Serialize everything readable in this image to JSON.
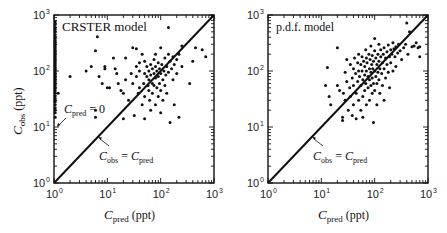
{
  "chart_data": [
    {
      "type": "scatter",
      "title": "CRSTER model",
      "xlabel": "C_pred (ppt)",
      "ylabel": "C_obs (ppt)",
      "xscale": "log",
      "yscale": "log",
      "xlim": [
        1,
        1000
      ],
      "ylim": [
        1,
        1000
      ],
      "x_ticks": [
        "10^0",
        "10^1",
        "10^2",
        "10^3"
      ],
      "y_ticks": [
        "10^0",
        "10^1",
        "10^2",
        "10^3"
      ],
      "annotations": [
        "C_pred = 0",
        "C_obs = C_pred"
      ],
      "reference_line": "y = x",
      "note": "Dense column of points at C_pred = 1 (C_pred = 0 cases) spanning C_obs ~15 to ~800",
      "points": [
        [
          1,
          15
        ],
        [
          1,
          18
        ],
        [
          1,
          20
        ],
        [
          1,
          22
        ],
        [
          1,
          25
        ],
        [
          1,
          28
        ],
        [
          1,
          30
        ],
        [
          1,
          33
        ],
        [
          1,
          36
        ],
        [
          1,
          40
        ],
        [
          1,
          44
        ],
        [
          1,
          48
        ],
        [
          1,
          52
        ],
        [
          1,
          56
        ],
        [
          1,
          60
        ],
        [
          1,
          65
        ],
        [
          1,
          70
        ],
        [
          1,
          75
        ],
        [
          1,
          80
        ],
        [
          1,
          86
        ],
        [
          1,
          92
        ],
        [
          1,
          100
        ],
        [
          1,
          108
        ],
        [
          1,
          116
        ],
        [
          1,
          125
        ],
        [
          1,
          135
        ],
        [
          1,
          145
        ],
        [
          1,
          156
        ],
        [
          1,
          168
        ],
        [
          1,
          180
        ],
        [
          1,
          195
        ],
        [
          1,
          210
        ],
        [
          1,
          225
        ],
        [
          1,
          240
        ],
        [
          1,
          260
        ],
        [
          1,
          280
        ],
        [
          1,
          300
        ],
        [
          1,
          325
        ],
        [
          1,
          350
        ],
        [
          1,
          380
        ],
        [
          1,
          410
        ],
        [
          1,
          450
        ],
        [
          1,
          500
        ],
        [
          1,
          550
        ],
        [
          1,
          600
        ],
        [
          1,
          680
        ],
        [
          1,
          760
        ],
        [
          1.2,
          40
        ],
        [
          2,
          80
        ],
        [
          4,
          100
        ],
        [
          5,
          120
        ],
        [
          6,
          20
        ],
        [
          6,
          15
        ],
        [
          6,
          230
        ],
        [
          6.5,
          410
        ],
        [
          7,
          80
        ],
        [
          8,
          60
        ],
        [
          9,
          120
        ],
        [
          9,
          110
        ],
        [
          10,
          50
        ],
        [
          11,
          50
        ],
        [
          13,
          170
        ],
        [
          14,
          110
        ],
        [
          15,
          90
        ],
        [
          16,
          60
        ],
        [
          18,
          45
        ],
        [
          20,
          40
        ],
        [
          20,
          14
        ],
        [
          22,
          170
        ],
        [
          22,
          70
        ],
        [
          25,
          30
        ],
        [
          28,
          90
        ],
        [
          30,
          260
        ],
        [
          30,
          60
        ],
        [
          32,
          16
        ],
        [
          35,
          250
        ],
        [
          35,
          120
        ],
        [
          35,
          80
        ],
        [
          38,
          40
        ],
        [
          40,
          140
        ],
        [
          40,
          100
        ],
        [
          40,
          50
        ],
        [
          45,
          200
        ],
        [
          45,
          25
        ],
        [
          48,
          60
        ],
        [
          50,
          150
        ],
        [
          50,
          90
        ],
        [
          50,
          35
        ],
        [
          50,
          14
        ],
        [
          55,
          80
        ],
        [
          55,
          120
        ],
        [
          58,
          55
        ],
        [
          60,
          100
        ],
        [
          60,
          70
        ],
        [
          60,
          45
        ],
        [
          62,
          30
        ],
        [
          65,
          130
        ],
        [
          65,
          85
        ],
        [
          65,
          20
        ],
        [
          70,
          110
        ],
        [
          70,
          60
        ],
        [
          70,
          40
        ],
        [
          75,
          160
        ],
        [
          75,
          90
        ],
        [
          75,
          55
        ],
        [
          80,
          200
        ],
        [
          80,
          120
        ],
        [
          80,
          75
        ],
        [
          80,
          25
        ],
        [
          85,
          100
        ],
        [
          85,
          50
        ],
        [
          90,
          140
        ],
        [
          90,
          80
        ],
        [
          90,
          35
        ],
        [
          95,
          110
        ],
        [
          95,
          60
        ],
        [
          100,
          260
        ],
        [
          100,
          90
        ],
        [
          100,
          45
        ],
        [
          100,
          18
        ],
        [
          105,
          130
        ],
        [
          110,
          70
        ],
        [
          110,
          30
        ],
        [
          115,
          100
        ],
        [
          120,
          170
        ],
        [
          120,
          55
        ],
        [
          125,
          85
        ],
        [
          130,
          120
        ],
        [
          130,
          40
        ],
        [
          140,
          600
        ],
        [
          140,
          200
        ],
        [
          140,
          95
        ],
        [
          150,
          150
        ],
        [
          150,
          12
        ],
        [
          160,
          110
        ],
        [
          170,
          180
        ],
        [
          170,
          70
        ],
        [
          180,
          130
        ],
        [
          180,
          25
        ],
        [
          200,
          160
        ],
        [
          200,
          90
        ],
        [
          220,
          200
        ],
        [
          220,
          15
        ],
        [
          250,
          280
        ],
        [
          250,
          120
        ],
        [
          350,
          60
        ],
        [
          400,
          150
        ],
        [
          450,
          260
        ],
        [
          600,
          240
        ],
        [
          700,
          180
        ]
      ]
    },
    {
      "type": "scatter",
      "title": "p.d.f. model",
      "xlabel": "C_pred (ppt)",
      "ylabel": "",
      "xscale": "log",
      "yscale": "log",
      "xlim": [
        1,
        1000
      ],
      "ylim": [
        1,
        1000
      ],
      "x_ticks": [
        "10^0",
        "10^1",
        "10^2",
        "10^3"
      ],
      "y_ticks": [
        "10^0",
        "10^1",
        "10^2",
        "10^3"
      ],
      "annotations": [
        "C_obs = C_pred"
      ],
      "reference_line": "y = x",
      "points": [
        [
          12,
          55
        ],
        [
          13,
          115
        ],
        [
          14,
          35
        ],
        [
          15,
          25
        ],
        [
          20,
          260
        ],
        [
          20,
          55
        ],
        [
          22,
          45
        ],
        [
          25,
          15
        ],
        [
          25,
          13
        ],
        [
          26,
          40
        ],
        [
          28,
          30
        ],
        [
          28,
          95
        ],
        [
          30,
          160
        ],
        [
          30,
          65
        ],
        [
          32,
          20
        ],
        [
          34,
          50
        ],
        [
          35,
          130
        ],
        [
          35,
          35
        ],
        [
          38,
          75
        ],
        [
          38,
          16
        ],
        [
          40,
          110
        ],
        [
          40,
          55
        ],
        [
          40,
          25
        ],
        [
          42,
          170
        ],
        [
          44,
          90
        ],
        [
          45,
          40
        ],
        [
          45,
          14
        ],
        [
          48,
          140
        ],
        [
          48,
          65
        ],
        [
          50,
          200
        ],
        [
          50,
          100
        ],
        [
          50,
          30
        ],
        [
          52,
          80
        ],
        [
          55,
          130
        ],
        [
          55,
          55
        ],
        [
          55,
          20
        ],
        [
          58,
          180
        ],
        [
          58,
          100
        ],
        [
          60,
          70
        ],
        [
          60,
          35
        ],
        [
          60,
          15
        ],
        [
          62,
          150
        ],
        [
          65,
          120
        ],
        [
          65,
          85
        ],
        [
          65,
          45
        ],
        [
          68,
          240
        ],
        [
          68,
          60
        ],
        [
          70,
          170
        ],
        [
          70,
          100
        ],
        [
          70,
          25
        ],
        [
          72,
          140
        ],
        [
          75,
          80
        ],
        [
          75,
          50
        ],
        [
          78,
          200
        ],
        [
          80,
          110
        ],
        [
          80,
          70
        ],
        [
          80,
          30
        ],
        [
          82,
          160
        ],
        [
          85,
          280
        ],
        [
          85,
          95
        ],
        [
          85,
          55
        ],
        [
          88,
          130
        ],
        [
          90,
          190
        ],
        [
          90,
          75
        ],
        [
          90,
          40
        ],
        [
          92,
          110
        ],
        [
          95,
          150
        ],
        [
          95,
          60
        ],
        [
          95,
          12
        ],
        [
          100,
          380
        ],
        [
          100,
          230
        ],
        [
          100,
          100
        ],
        [
          100,
          45
        ],
        [
          105,
          170
        ],
        [
          105,
          80
        ],
        [
          110,
          130
        ],
        [
          110,
          60
        ],
        [
          110,
          25
        ],
        [
          115,
          200
        ],
        [
          115,
          95
        ],
        [
          120,
          300
        ],
        [
          120,
          150
        ],
        [
          120,
          70
        ],
        [
          125,
          110
        ],
        [
          125,
          40
        ],
        [
          130,
          240
        ],
        [
          130,
          180
        ],
        [
          135,
          90
        ],
        [
          140,
          140
        ],
        [
          140,
          55
        ],
        [
          145,
          200
        ],
        [
          150,
          260
        ],
        [
          150,
          110
        ],
        [
          150,
          30
        ],
        [
          160,
          170
        ],
        [
          160,
          75
        ],
        [
          170,
          220
        ],
        [
          170,
          130
        ],
        [
          180,
          290
        ],
        [
          180,
          95
        ],
        [
          190,
          180
        ],
        [
          190,
          50
        ],
        [
          200,
          240
        ],
        [
          200,
          140
        ],
        [
          210,
          200
        ],
        [
          220,
          320
        ],
        [
          220,
          100
        ],
        [
          230,
          250
        ],
        [
          240,
          180
        ],
        [
          250,
          270
        ],
        [
          250,
          120
        ],
        [
          270,
          210
        ],
        [
          280,
          300
        ],
        [
          300,
          230
        ],
        [
          320,
          160
        ],
        [
          350,
          260
        ],
        [
          380,
          300
        ],
        [
          400,
          720
        ],
        [
          420,
          200
        ],
        [
          450,
          500
        ],
        [
          500,
          270
        ],
        [
          550,
          280
        ],
        [
          600,
          320
        ],
        [
          650,
          260
        ],
        [
          700,
          270
        ],
        [
          700,
          180
        ]
      ]
    }
  ],
  "panels": {
    "left": {
      "label": "CRSTER model",
      "annotation_zero": "C_pred = 0",
      "annotation_line": "C_obs = C_pred"
    },
    "right": {
      "label": "p.d.f. model",
      "annotation_line": "C_obs = C_pred"
    }
  },
  "axes": {
    "y_label": "C_obs (ppt)",
    "x_label": "C_pred (ppt)"
  }
}
